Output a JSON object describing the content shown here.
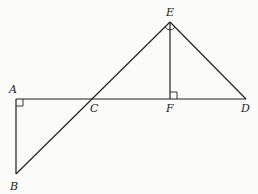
{
  "diagram": {
    "type": "geometry",
    "points": {
      "A": {
        "label": "A",
        "x": 16,
        "y": 99
      },
      "B": {
        "label": "B",
        "x": 16,
        "y": 174
      },
      "C": {
        "label": "C",
        "x": 92,
        "y": 99
      },
      "D": {
        "label": "D",
        "x": 246,
        "y": 99
      },
      "E": {
        "label": "E",
        "x": 170,
        "y": 22
      },
      "F": {
        "label": "F",
        "x": 170,
        "y": 99
      }
    },
    "segments": [
      "AD",
      "AB",
      "BE",
      "ED",
      "EF"
    ],
    "right_angles": [
      "A (BAC)",
      "F (EFD)",
      "E (CED)"
    ],
    "stroke_color": "#222222",
    "background_color": "#fbfbfa"
  }
}
